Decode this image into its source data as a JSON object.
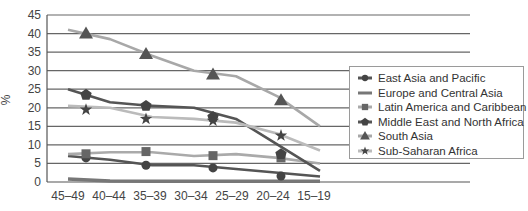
{
  "chart_data": {
    "type": "line",
    "title": "",
    "xlabel": "",
    "ylabel": "%",
    "ylim": [
      0,
      45
    ],
    "yticks": [
      0,
      5,
      10,
      15,
      20,
      25,
      30,
      35,
      40,
      45
    ],
    "grid": true,
    "legend_position": "right",
    "categories": [
      "45–49",
      "40–44",
      "35–39",
      "30–34",
      "25–29",
      "20–24",
      "15–19"
    ],
    "series": [
      {
        "name": "East Asia and Pacific",
        "marker": "circle",
        "line_color": "#555555",
        "marker_color": "#444444",
        "values": [
          7,
          6,
          4.5,
          4.5,
          3.5,
          2.5,
          1.5
        ],
        "marker_values": [
          6.5,
          4.5,
          3.8,
          1.6
        ]
      },
      {
        "name": "Europe and Central Asia",
        "marker": "none",
        "line_color": "#777777",
        "marker_color": "#777777",
        "values": [
          0.8,
          0.3,
          0.2,
          0.2,
          0.2,
          0.2,
          0.2
        ],
        "marker_values": []
      },
      {
        "name": "Latin America and Caribbean",
        "marker": "square",
        "line_color": "#aaaaaa",
        "marker_color": "#666666",
        "values": [
          7.5,
          8,
          8,
          7,
          7.5,
          6.5,
          5
        ],
        "marker_values": [
          7.6,
          8.2,
          7.1,
          6.5
        ]
      },
      {
        "name": "Middle East and North Africa",
        "marker": "pentagon",
        "line_color": "#555555",
        "marker_color": "#444444",
        "values": [
          25,
          21.5,
          20.5,
          20,
          17,
          10,
          3
        ],
        "marker_values": [
          23.5,
          20.5,
          17.5,
          7.5
        ]
      },
      {
        "name": "South Asia",
        "marker": "triangle",
        "line_color": "#a8a8a8",
        "marker_color": "#555555",
        "values": [
          41,
          38.5,
          34,
          30,
          28.5,
          23,
          15
        ],
        "marker_values": [
          40,
          34.5,
          29,
          22
        ]
      },
      {
        "name": "Sub-Saharan Africa",
        "marker": "star",
        "line_color": "#bbbbbb",
        "marker_color": "#444444",
        "values": [
          20.5,
          20,
          17.5,
          17,
          16,
          13,
          8.5
        ],
        "marker_values": [
          19.5,
          17,
          16.5,
          12.5
        ]
      }
    ]
  },
  "legend": {
    "items": [
      {
        "label": "East Asia and Pacific",
        "icon": "circle-marker-icon"
      },
      {
        "label": "Europe and Central Asia",
        "icon": "line-icon"
      },
      {
        "label": "Latin America and Caribbean",
        "icon": "square-marker-icon"
      },
      {
        "label": "Middle East and North Africa",
        "icon": "pentagon-marker-icon"
      },
      {
        "label": "South Asia",
        "icon": "triangle-marker-icon"
      },
      {
        "label": "Sub-Saharan Africa",
        "icon": "star-marker-icon"
      }
    ]
  }
}
